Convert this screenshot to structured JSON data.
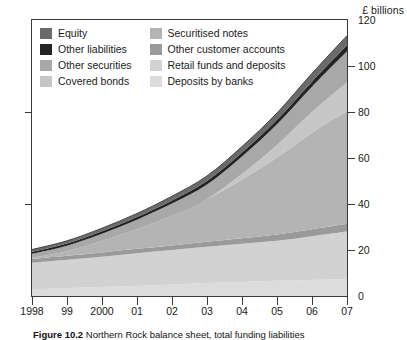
{
  "units_label": "£ billions",
  "caption": {
    "figure_no": "Figure 10.2",
    "text": "Northern Rock balance sheet, total funding liabilities"
  },
  "legend": {
    "items": [
      {
        "label": "Equity",
        "color": "#6b6b6b",
        "column": 1,
        "row": 1
      },
      {
        "label": "Other liabilities",
        "color": "#242424",
        "column": 1,
        "row": 2
      },
      {
        "label": "Other securities",
        "color": "#a8a8a8",
        "column": 1,
        "row": 3
      },
      {
        "label": "Covered bonds",
        "color": "#c6c6c6",
        "column": 1,
        "row": 4
      },
      {
        "label": "Securitised notes",
        "color": "#b4b4b4",
        "column": 2,
        "row": 1
      },
      {
        "label": "Other customer accounts",
        "color": "#9a9a9a",
        "column": 2,
        "row": 2
      },
      {
        "label": "Retail funds and deposits",
        "color": "#d2d2d2",
        "column": 2,
        "row": 3
      },
      {
        "label": "Deposits by banks",
        "color": "#dcdcdc",
        "column": 2,
        "row": 4
      }
    ]
  },
  "chart_data": {
    "type": "area",
    "stacked": true,
    "title": "",
    "subtitle": "",
    "xlabel": "",
    "ylabel": "£ billions",
    "ylim": [
      0,
      120
    ],
    "ytick_values": [
      0,
      20,
      40,
      60,
      80,
      100,
      120
    ],
    "ytick_labels": [
      "0",
      "20",
      "40",
      "60",
      "80",
      "100",
      "120"
    ],
    "yaxis_position": "right",
    "grid": false,
    "legend_position": "inside-top-left",
    "x": [
      1998,
      1999,
      2000,
      2001,
      2002,
      2003,
      2004,
      2005,
      2006,
      2007
    ],
    "categories": [
      "1998",
      "99",
      "2000",
      "01",
      "02",
      "03",
      "04",
      "05",
      "06",
      "07"
    ],
    "series": [
      {
        "name": "Deposits by banks",
        "color": "#dcdcdc",
        "values": [
          3.0,
          3.4,
          3.9,
          4.4,
          5.0,
          5.6,
          6.1,
          6.6,
          7.0,
          7.4
        ]
      },
      {
        "name": "Retail funds and deposits",
        "color": "#d2d2d2",
        "values": [
          11.5,
          12.4,
          13.2,
          14.2,
          15.0,
          15.8,
          16.6,
          17.4,
          19.0,
          20.6
        ]
      },
      {
        "name": "Other customer accounts",
        "color": "#9a9a9a",
        "values": [
          1.6,
          1.7,
          1.8,
          1.9,
          2.0,
          2.2,
          2.4,
          2.7,
          3.0,
          3.4
        ]
      },
      {
        "name": "Securitised notes",
        "color": "#b4b4b4",
        "values": [
          0.5,
          2.0,
          5.0,
          8.5,
          13.0,
          18.5,
          25.5,
          33.5,
          42.0,
          49.0
        ]
      },
      {
        "name": "Covered bonds",
        "color": "#c6c6c6",
        "values": [
          0.0,
          0.0,
          0.0,
          0.0,
          0.0,
          0.0,
          2.5,
          5.5,
          9.0,
          12.5
        ]
      },
      {
        "name": "Other securities",
        "color": "#a8a8a8",
        "values": [
          1.8,
          2.4,
          3.2,
          4.2,
          5.2,
          6.4,
          7.6,
          9.0,
          11.0,
          13.5
        ]
      },
      {
        "name": "Other liabilities",
        "color": "#242424",
        "values": [
          0.8,
          0.9,
          1.0,
          1.1,
          1.3,
          1.5,
          1.7,
          1.9,
          2.2,
          2.6
        ]
      },
      {
        "name": "Equity",
        "color": "#6b6b6b",
        "values": [
          1.0,
          1.2,
          1.4,
          1.6,
          1.9,
          2.2,
          2.6,
          3.0,
          3.6,
          4.2
        ]
      }
    ],
    "totals": [
      20.2,
      24.0,
      29.5,
      35.9,
      43.4,
      52.2,
      65.0,
      79.6,
      96.8,
      113.2
    ]
  }
}
